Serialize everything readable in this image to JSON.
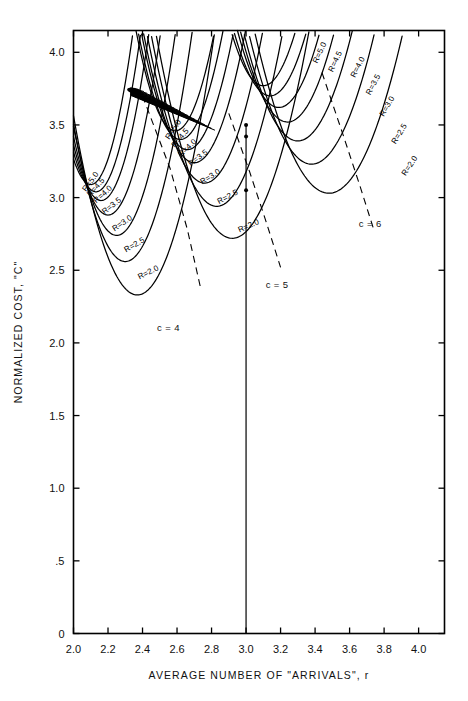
{
  "figure": {
    "title": "",
    "background": "#ffffff",
    "ink": "#000000"
  },
  "axes": {
    "x": {
      "label": "AVERAGE NUMBER OF \"ARRIVALS\", r",
      "ticks": [
        "2.0",
        "2.2",
        "2.4",
        "2.6",
        "2.8",
        "3.0",
        "3.2",
        "3.4",
        "3.6",
        "3.8",
        "4.0"
      ],
      "tick_values": [
        2.0,
        2.2,
        2.4,
        2.6,
        2.8,
        3.0,
        3.2,
        3.4,
        3.6,
        3.8,
        4.0
      ],
      "range": [
        2.0,
        4.15
      ]
    },
    "y": {
      "label": "NORMALIZED COST, \"C\"",
      "ticks": [
        "0",
        ".5",
        "1.0",
        "1.5",
        "2.0",
        "2.5",
        "3.0",
        "3.5",
        "4.0"
      ],
      "tick_values": [
        0,
        0.5,
        1.0,
        1.5,
        2.0,
        2.5,
        3.0,
        3.5,
        4.0
      ],
      "range": [
        0,
        4.15
      ]
    }
  },
  "annotations": {
    "families": [
      {
        "name": "c-4",
        "label": "c = 4",
        "x": 2.55,
        "y": 2.08
      },
      {
        "name": "c-5",
        "label": "c = 5",
        "x": 3.18,
        "y": 2.38
      },
      {
        "name": "c-6",
        "label": "c = 6",
        "x": 3.72,
        "y": 2.8
      }
    ]
  },
  "chart_data": {
    "type": "line",
    "title": "",
    "xlabel": "AVERAGE NUMBER OF \"ARRIVALS\", r",
    "ylabel": "NORMALIZED COST, \"C\"",
    "xlim": [
      2.0,
      4.15
    ],
    "ylim": [
      0,
      4.15
    ],
    "grid": false,
    "legend": "inline-curve-labels",
    "x_ticks": [
      2.0,
      2.2,
      2.4,
      2.6,
      2.8,
      3.0,
      3.2,
      3.4,
      3.6,
      3.8,
      4.0
    ],
    "y_ticks": [
      0,
      0.5,
      1.0,
      1.5,
      2.0,
      2.5,
      3.0,
      3.5,
      4.0
    ],
    "r_values": [
      2.0,
      2.5,
      3.0,
      3.5,
      4.0,
      4.5,
      5.0
    ],
    "families": [
      {
        "c": 4,
        "family_label": "c = 4",
        "series": [
          {
            "name": "R=2.0",
            "label": "R=2.0",
            "vertex": [
              2.37,
              2.33
            ],
            "curvature": 9.0,
            "label_x": 2.44,
            "label_y": 2.47,
            "label_rot": -27,
            "x_start": 2.0,
            "x_end": 2.96
          },
          {
            "name": "R=2.5",
            "label": "R=2.5",
            "vertex": [
              2.3,
              2.56
            ],
            "curvature": 10.5,
            "label_x": 2.36,
            "label_y": 2.66,
            "label_rot": -30,
            "x_start": 2.0,
            "x_end": 2.88
          },
          {
            "name": "R=3.0",
            "label": "R=3.0",
            "vertex": [
              2.25,
              2.74
            ],
            "curvature": 12.0,
            "label_x": 2.29,
            "label_y": 2.81,
            "label_rot": -34,
            "x_start": 2.0,
            "x_end": 2.82
          },
          {
            "name": "R=3.5",
            "label": "R=3.5",
            "vertex": [
              2.2,
              2.88
            ],
            "curvature": 13.5,
            "label_x": 2.23,
            "label_y": 2.93,
            "label_rot": -38,
            "x_start": 2.0,
            "x_end": 2.78
          },
          {
            "name": "R=4.0",
            "label": "R=4.0",
            "vertex": [
              2.16,
              2.98
            ],
            "curvature": 15.0,
            "label_x": 2.18,
            "label_y": 3.01,
            "label_rot": -42,
            "x_start": 2.0,
            "x_end": 2.75
          },
          {
            "name": "R=4.5",
            "label": "R=4.5",
            "vertex": [
              2.13,
              3.04
            ],
            "curvature": 16.2,
            "label_x": 2.14,
            "label_y": 3.06,
            "label_rot": -48,
            "x_start": 2.0,
            "x_end": 2.73
          },
          {
            "name": "R=5.0",
            "label": "R=5.0",
            "vertex": [
              2.1,
              3.09
            ],
            "curvature": 17.5,
            "label_x": 2.11,
            "label_y": 3.1,
            "label_rot": -54,
            "x_start": 2.0,
            "x_end": 2.71
          }
        ],
        "converge_point": [
          2.56,
          3.74
        ],
        "dashed_locus": [
          [
            2.4,
            3.7
          ],
          [
            2.56,
            3.2
          ],
          [
            2.66,
            2.78
          ],
          [
            2.74,
            2.36
          ]
        ]
      },
      {
        "c": 5,
        "family_label": "c = 5",
        "series": [
          {
            "name": "R=2.0",
            "label": "R=2.0",
            "vertex": [
              2.92,
              2.72
            ],
            "curvature": 7.2,
            "label_x": 3.02,
            "label_y": 2.79,
            "label_rot": -24,
            "x_start": 2.38,
            "x_end": 3.62
          },
          {
            "name": "R=2.5",
            "label": "R=2.5",
            "vertex": [
              2.83,
              2.94
            ],
            "curvature": 8.2,
            "label_x": 2.9,
            "label_y": 2.99,
            "label_rot": -28,
            "x_start": 2.3,
            "x_end": 3.52
          },
          {
            "name": "R=3.0",
            "label": "R=3.0",
            "vertex": [
              2.76,
              3.1
            ],
            "curvature": 9.2,
            "label_x": 2.8,
            "label_y": 3.13,
            "label_rot": -32,
            "x_start": 2.24,
            "x_end": 3.45
          },
          {
            "name": "R=3.5",
            "label": "R=3.5",
            "vertex": [
              2.7,
              3.24
            ],
            "curvature": 10.3,
            "label_x": 2.73,
            "label_y": 3.26,
            "label_rot": -37,
            "x_start": 2.2,
            "x_end": 3.38
          },
          {
            "name": "R=4.0",
            "label": "R=4.0",
            "vertex": [
              2.66,
              3.33
            ],
            "curvature": 11.3,
            "label_x": 2.67,
            "label_y": 3.33,
            "label_rot": -43,
            "x_start": 2.17,
            "x_end": 3.33
          },
          {
            "name": "R=4.5",
            "label": "R=4.5",
            "vertex": [
              2.62,
              3.4
            ],
            "curvature": 12.3,
            "label_x": 2.63,
            "label_y": 3.4,
            "label_rot": -50,
            "x_start": 2.14,
            "x_end": 3.29
          },
          {
            "name": "R=5.0",
            "label": "R=5.0",
            "vertex": [
              2.59,
              3.46
            ],
            "curvature": 13.3,
            "label_x": 2.59,
            "label_y": 3.46,
            "label_rot": -56,
            "x_start": 2.12,
            "x_end": 3.26
          }
        ],
        "converge_point": [
          3.02,
          4.15
        ],
        "dashed_locus": [
          [
            2.9,
            3.58
          ],
          [
            3.02,
            3.18
          ],
          [
            3.12,
            2.82
          ],
          [
            3.2,
            2.52
          ]
        ]
      },
      {
        "c": 6,
        "family_label": "c = 6",
        "series": [
          {
            "name": "R=2.0",
            "label": "R=2.0",
            "vertex": [
              3.48,
              3.03
            ],
            "curvature": 6.0,
            "label_x": 3.96,
            "label_y": 3.21,
            "label_rot": -56,
            "x_start": 2.84,
            "x_end": 4.15
          },
          {
            "name": "R=2.5",
            "label": "R=2.5",
            "vertex": [
              3.38,
              3.23
            ],
            "curvature": 6.8,
            "label_x": 3.9,
            "label_y": 3.43,
            "label_rot": -58,
            "x_start": 2.76,
            "x_end": 4.15
          },
          {
            "name": "R=3.0",
            "label": "R=3.0",
            "vertex": [
              3.3,
              3.39
            ],
            "curvature": 7.6,
            "label_x": 3.83,
            "label_y": 3.62,
            "label_rot": -60,
            "x_start": 2.7,
            "x_end": 4.15
          },
          {
            "name": "R=3.5",
            "label": "R=3.5",
            "vertex": [
              3.24,
              3.52
            ],
            "curvature": 8.4,
            "label_x": 3.75,
            "label_y": 3.77,
            "label_rot": -62,
            "x_start": 2.64,
            "x_end": 4.1
          },
          {
            "name": "R=4.0",
            "label": "R=4.0",
            "vertex": [
              3.19,
              3.62
            ],
            "curvature": 9.2,
            "label_x": 3.66,
            "label_y": 3.89,
            "label_rot": -63,
            "x_start": 2.6,
            "x_end": 4.0
          },
          {
            "name": "R=4.5",
            "label": "R=4.5",
            "vertex": [
              3.14,
              3.7
            ],
            "curvature": 10.0,
            "label_x": 3.53,
            "label_y": 3.93,
            "label_rot": -64,
            "x_start": 2.57,
            "x_end": 3.92
          },
          {
            "name": "R=5.0",
            "label": "R=5.0",
            "vertex": [
              3.1,
              3.77
            ],
            "curvature": 10.8,
            "label_x": 3.44,
            "label_y": 3.99,
            "label_rot": -65,
            "x_start": 2.54,
            "x_end": 3.86
          }
        ],
        "converge_point": [
          3.5,
          4.15
        ],
        "dashed_locus": [
          [
            3.44,
            3.86
          ],
          [
            3.56,
            3.44
          ],
          [
            3.66,
            3.08
          ],
          [
            3.74,
            2.78
          ]
        ]
      }
    ],
    "reference_line": {
      "name": "r-equals-3-vertical",
      "x": 3.0,
      "y_top": 3.5,
      "y_bottom": 0.0,
      "style": "solid"
    },
    "marked_points": [
      {
        "x": 3.0,
        "y": 3.5
      },
      {
        "x": 3.0,
        "y": 3.42
      },
      {
        "x": 3.0,
        "y": 3.05
      }
    ]
  }
}
